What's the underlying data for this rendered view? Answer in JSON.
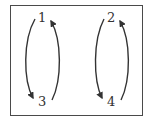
{
  "diagram": {
    "type": "cycle-diagram",
    "nodes": [
      {
        "id": "n1",
        "label": "1"
      },
      {
        "id": "n2",
        "label": "2"
      },
      {
        "id": "n3",
        "label": "3"
      },
      {
        "id": "n4",
        "label": "4"
      }
    ],
    "edges": [
      {
        "from": "1",
        "to": "3",
        "side": "left"
      },
      {
        "from": "3",
        "to": "1",
        "side": "right"
      },
      {
        "from": "2",
        "to": "4",
        "side": "left"
      },
      {
        "from": "4",
        "to": "2",
        "side": "right"
      }
    ],
    "colors": {
      "stroke": "#333333",
      "frame": "#4a4a4a",
      "background": "#ffffff"
    }
  }
}
